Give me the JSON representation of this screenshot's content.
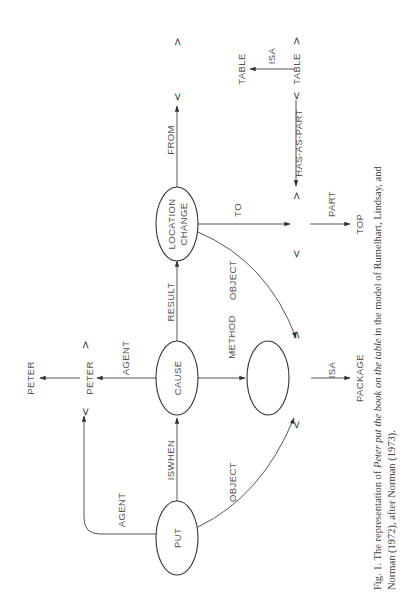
{
  "figure": {
    "orientation": "rotated 90 degrees counter-clockwise",
    "nodes": {
      "put": "PUT",
      "cause": "CAUSE",
      "location_change_line1": "LOCATION",
      "location_change_line2": "CHANGE",
      "method_node": "",
      "peter_instance": "PETER",
      "peter_concept": "PETER",
      "package": "PACKAGE",
      "top": "TOP",
      "table_instance": "TABLE",
      "table_concept": "TABLE"
    },
    "edges": {
      "put_agent": "AGENT",
      "put_iswhen": "ISWHEN",
      "put_object": "OBJECT",
      "cause_agent": "AGENT",
      "cause_result": "RESULT",
      "cause_method": "METHOD",
      "lc_object": "OBJECT",
      "lc_to": "TO",
      "lc_from": "FROM",
      "package_isa": "ISA",
      "part": "PART",
      "has_as_part": "HAS-AS-PART",
      "table_isa": "ISA"
    },
    "symbols": {
      "lt": "<",
      "gt": ">"
    }
  },
  "caption": {
    "line1_prefix": "Fig. 1.  The representation of ",
    "line1_italic": "Peter put the book on the table",
    "line1_suffix": " in the model of Rumelhart, Lindsay, and",
    "line2": "Norman (1972), after Norman (1973)."
  }
}
